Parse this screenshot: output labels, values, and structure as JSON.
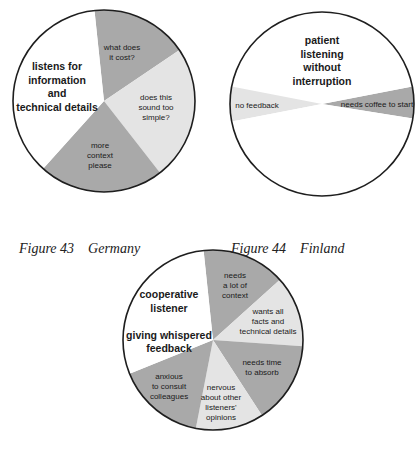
{
  "colors": {
    "white": "#ffffff",
    "light": "#e4e4e4",
    "dark": "#a9a9a9",
    "outline": "#1e1e1e"
  },
  "chart_data": [
    {
      "type": "pie",
      "title": "Germany",
      "figure_label": "Figure 43",
      "center": [
        104,
        101
      ],
      "radius": 91,
      "slices": [
        {
          "label": "what does it cost?",
          "start_deg": 96,
          "end_deg": 34,
          "shade": "dark",
          "text_pos": [
            122,
            50
          ],
          "lines": [
            "what does",
            "it cost?"
          ],
          "style": "small"
        },
        {
          "label": "does this sound too simple?",
          "start_deg": 34,
          "end_deg": -52,
          "shade": "light",
          "text_pos": [
            156,
            100
          ],
          "lines": [
            "does this",
            "sound too",
            "simple?"
          ],
          "style": "small"
        },
        {
          "label": "more context please",
          "start_deg": -52,
          "end_deg": -132,
          "shade": "dark",
          "text_pos": [
            100,
            148
          ],
          "lines": [
            "more",
            "context",
            "please"
          ],
          "style": "small"
        },
        {
          "label": "listens for information and technical details",
          "start_deg": -132,
          "end_deg": -264,
          "shade": "white",
          "text_pos": [
            57,
            70
          ],
          "lines": [
            "listens for",
            "information",
            "and",
            "technical details"
          ],
          "style": "bold"
        }
      ]
    },
    {
      "type": "pie",
      "title": "Finland",
      "figure_label": "Figure 44",
      "center": [
        322,
        104
      ],
      "radius": 92,
      "slices": [
        {
          "label": "needs coffee to start",
          "start_deg": 11,
          "end_deg": -9,
          "shade": "dark",
          "text_pos": [
            377,
            107
          ],
          "lines": [
            "needs coffee to start"
          ],
          "style": "small"
        },
        {
          "label": "patient listening without interruption (upper)",
          "start_deg": 169,
          "end_deg": 11,
          "shade": "white",
          "text_pos": [
            322,
            44
          ],
          "lines": [
            "patient",
            "listening",
            "without",
            "interruption"
          ],
          "style": "bold"
        },
        {
          "label": "no feedback",
          "start_deg": 191,
          "end_deg": 169,
          "shade": "light",
          "text_pos": [
            257,
            108
          ],
          "lines": [
            "no feedback"
          ],
          "style": "small"
        },
        {
          "label": "patient listening without interruption (lower)",
          "start_deg": 351,
          "end_deg": 191,
          "shade": "white",
          "text_pos": null,
          "lines": [],
          "style": "bold"
        }
      ]
    },
    {
      "type": "pie",
      "title": "",
      "figure_label": "",
      "center": [
        213,
        340
      ],
      "radius": 90,
      "slices": [
        {
          "label": "needs a lot of context",
          "start_deg": 96,
          "end_deg": 42,
          "shade": "dark",
          "text_pos": [
            235,
            278
          ],
          "lines": [
            "needs",
            "a lot of",
            "context"
          ],
          "style": "small"
        },
        {
          "label": "wants all facts and technical details",
          "start_deg": 42,
          "end_deg": -4,
          "shade": "light",
          "text_pos": [
            268,
            314
          ],
          "lines": [
            "wants all",
            "facts and",
            "technical details"
          ],
          "style": "small"
        },
        {
          "label": "needs time to absorb",
          "start_deg": -4,
          "end_deg": -57,
          "shade": "dark",
          "text_pos": [
            262,
            365
          ],
          "lines": [
            "needs time",
            "to absorb"
          ],
          "style": "small"
        },
        {
          "label": "nervous about other listeners' opinions",
          "start_deg": -57,
          "end_deg": -101,
          "shade": "light",
          "text_pos": [
            221,
            390
          ],
          "lines": [
            "nervous",
            "about other",
            "listeners'",
            "opinions"
          ],
          "style": "small"
        },
        {
          "label": "anxious to consult colleagues",
          "start_deg": -101,
          "end_deg": -158,
          "shade": "dark",
          "text_pos": [
            169,
            379
          ],
          "lines": [
            "anxious",
            "to consult",
            "colleagues"
          ],
          "style": "small"
        },
        {
          "label": "cooperative listener giving whispered feedback",
          "start_deg": -158,
          "end_deg": -264,
          "shade": "white",
          "text_pos": [
            169,
            298
          ],
          "lines": [
            "cooperative",
            "listener",
            "",
            "giving whispered",
            "feedback"
          ],
          "style": "bold"
        }
      ]
    }
  ],
  "captions": [
    {
      "figure": "Figure 43",
      "country": "Germany"
    },
    {
      "figure": "Figure 44",
      "country": "Finland"
    }
  ]
}
